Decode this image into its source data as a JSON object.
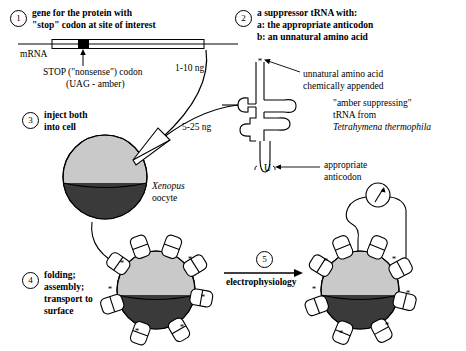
{
  "steps": [
    {
      "num": "1",
      "lines": [
        "gene for the protein with",
        "\"stop\" codon at site of interest"
      ]
    },
    {
      "num": "2",
      "lines": [
        "a suppressor tRNA with:",
        "a: the appropriate anticodon",
        "b: an unnatural amino acid"
      ]
    },
    {
      "num": "3",
      "lines": [
        "inject both",
        "into cell"
      ]
    },
    {
      "num": "4",
      "lines": [
        "folding;",
        "assembly;",
        "transport to",
        "surface"
      ]
    },
    {
      "num": "5",
      "lines": [
        "electrophysiology"
      ]
    }
  ],
  "labels": {
    "mrna": "mRNA",
    "stop_codon_1": "STOP (\"nonsense\") codon",
    "stop_codon_2": "(UAG - amber)",
    "dose_mrna": "1-10 ng",
    "dose_trna": "5-25 ng",
    "unnatural_1": "unnatural amino acid",
    "unnatural_2": "chemically appended",
    "amber_1": "\"amber suppressing\"",
    "amber_2": "tRNA from",
    "amber_species": "Tetrahymena thermophila",
    "anticodon_1": "appropriate",
    "anticodon_2": "anticodon",
    "anticodon_base": "U",
    "oocyte_genus": "Xenopus",
    "oocyte_cell": "oocyte",
    "electrophysiology": "electrophysiology"
  },
  "icons": {
    "mrna_bar": "mrna-bar-icon",
    "stop_block": "stop-codon-block-icon",
    "trna": "trna-cloverleaf-icon",
    "pipette": "injection-pipette-icon",
    "oocyte": "xenopus-oocyte-icon",
    "meter": "voltmeter-icon",
    "asterisk": "unnatural-amino-acid-asterisk-icon",
    "channel": "membrane-protein-subunit-icon",
    "arrow": "flow-arrow-icon"
  },
  "colors": {
    "stroke": "#000000",
    "animal_pole": "#3a3a3a",
    "vegetal_pole": "#c9c9c9",
    "protein_fill": "#ffffff",
    "background": "#ffffff"
  }
}
